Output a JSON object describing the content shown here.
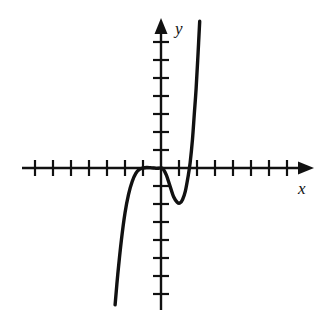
{
  "figure": {
    "background_color": "#ffffff",
    "stroke_color": "#111111",
    "axis_color": "#111111"
  },
  "labels": {
    "y_axis": "y",
    "x_axis": "x"
  },
  "icons": {
    "x_arrow": "arrow-right-icon",
    "y_arrow": "arrow-up-icon"
  },
  "chart_data": {
    "type": "line",
    "title": "",
    "subtitle": "",
    "xlabel": "x",
    "ylabel": "y",
    "grid": false,
    "legend": null,
    "annotations": [],
    "axes": {
      "origin_px": [
        161,
        168
      ],
      "unit_px": 18.0,
      "x_ticks": [
        -7,
        -6,
        -5,
        -4,
        -3,
        -2,
        -1,
        1,
        2,
        3,
        4,
        5,
        6,
        7
      ],
      "y_ticks": [
        -7,
        -6,
        -5,
        -4,
        -3,
        -2,
        -1,
        1,
        2,
        3,
        4,
        5,
        6,
        7
      ],
      "x_tick_count_left": 7,
      "x_tick_count_right": 7,
      "y_tick_count_up": 7,
      "y_tick_count_down": 7,
      "tick_labels_shown": false,
      "xlim": [
        -8.1,
        8.6
      ],
      "ylim": [
        -8.3,
        8.2
      ],
      "arrow_x": true,
      "arrow_y": true
    },
    "features": {
      "local_max": [
        0,
        0
      ],
      "local_min": [
        1.05,
        -1.95
      ],
      "x_intercepts": [
        -2.2,
        0,
        1.7
      ],
      "y_intercept": 0,
      "end_behavior_left": "down",
      "end_behavior_right": "up"
    },
    "x": [
      -2.55,
      -2.4,
      -2.2,
      -2.0,
      -1.8,
      -1.6,
      -1.4,
      -1.2,
      -1.0,
      -0.8,
      -0.6,
      -0.4,
      -0.25,
      -0.1,
      0.0,
      0.12,
      0.3,
      0.5,
      0.7,
      0.9,
      1.05,
      1.2,
      1.35,
      1.5,
      1.62,
      1.75,
      1.85,
      1.95,
      2.05,
      2.15
    ],
    "y": [
      -7.6,
      -5.9,
      -4.0,
      -2.5,
      -1.45,
      -0.75,
      -0.3,
      -0.08,
      0.0,
      0.03,
      0.02,
      0.0,
      -0.02,
      -0.01,
      0.0,
      -0.05,
      -0.4,
      -1.0,
      -1.6,
      -1.9,
      -1.95,
      -1.75,
      -1.3,
      -0.5,
      0.3,
      1.6,
      3.0,
      4.4,
      6.2,
      8.15
    ],
    "series": [
      {
        "name": "curve",
        "x": [
          -2.55,
          -2.4,
          -2.2,
          -2.0,
          -1.8,
          -1.6,
          -1.4,
          -1.2,
          -1.0,
          -0.8,
          -0.6,
          -0.4,
          -0.25,
          -0.1,
          0.0,
          0.12,
          0.3,
          0.5,
          0.7,
          0.9,
          1.05,
          1.2,
          1.35,
          1.5,
          1.62,
          1.75,
          1.85,
          1.95,
          2.05,
          2.15
        ],
        "y": [
          -7.6,
          -5.9,
          -4.0,
          -2.5,
          -1.45,
          -0.75,
          -0.3,
          -0.08,
          0.0,
          0.03,
          0.02,
          0.0,
          -0.02,
          -0.01,
          0.0,
          -0.05,
          -0.4,
          -1.0,
          -1.6,
          -1.9,
          -1.95,
          -1.75,
          -1.3,
          -0.5,
          0.3,
          1.6,
          3.0,
          4.4,
          6.2,
          8.15
        ]
      }
    ]
  }
}
